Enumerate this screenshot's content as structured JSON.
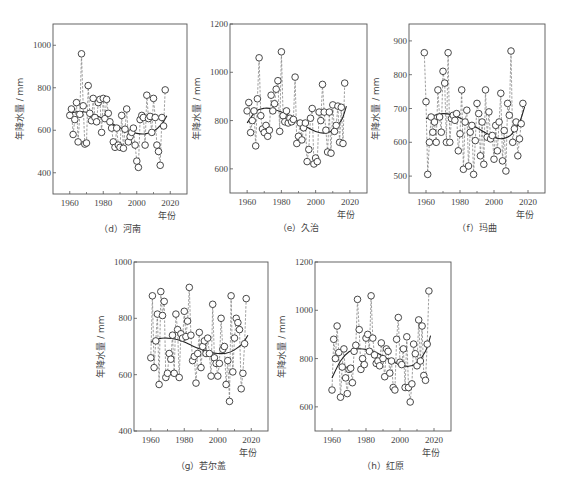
{
  "chart_data": [
    {
      "id": "d",
      "type": "scatter",
      "title": "（d）河南",
      "caption": "（d）河南",
      "xlabel": "年份",
      "ylabel": "年降水量 / mm",
      "xlim": [
        1950,
        2030
      ],
      "ylim": [
        300,
        1100
      ],
      "xticks": [
        1960,
        1980,
        2000,
        2020
      ],
      "xminor": [
        1970,
        1990,
        2010
      ],
      "yticks": [
        400,
        600,
        800,
        1000
      ],
      "frame": {
        "x0": 53,
        "x1": 187,
        "y0": 24,
        "y1": 194
      },
      "x": [
        1960,
        1961,
        1962,
        1963,
        1964,
        1965,
        1966,
        1967,
        1968,
        1969,
        1970,
        1971,
        1972,
        1973,
        1974,
        1975,
        1976,
        1977,
        1978,
        1979,
        1980,
        1981,
        1982,
        1983,
        1984,
        1985,
        1986,
        1987,
        1988,
        1989,
        1990,
        1991,
        1992,
        1993,
        1994,
        1995,
        1996,
        1997,
        1998,
        1999,
        2000,
        2001,
        2002,
        2003,
        2004,
        2005,
        2006,
        2007,
        2008,
        2009,
        2010,
        2011,
        2012,
        2013,
        2014,
        2015,
        2016,
        2017
      ],
      "values": [
        670,
        700,
        580,
        650,
        730,
        545,
        675,
        960,
        715,
        535,
        540,
        810,
        680,
        645,
        750,
        660,
        640,
        730,
        745,
        590,
        750,
        655,
        745,
        680,
        640,
        610,
        545,
        520,
        610,
        530,
        520,
        670,
        515,
        605,
        700,
        545,
        570,
        590,
        610,
        530,
        455,
        425,
        650,
        670,
        660,
        530,
        765,
        655,
        665,
        590,
        750,
        660,
        530,
        500,
        435,
        660,
        620,
        790
      ],
      "trend": {
        "type": "polynomial",
        "points": [
          [
            1960,
            680
          ],
          [
            1965,
            688
          ],
          [
            1970,
            685
          ],
          [
            1975,
            672
          ],
          [
            1980,
            655
          ],
          [
            1985,
            633
          ],
          [
            1990,
            612
          ],
          [
            1995,
            597
          ],
          [
            2000,
            585
          ],
          [
            2005,
            583
          ],
          [
            2010,
            595
          ],
          [
            2015,
            630
          ],
          [
            2018,
            668
          ]
        ]
      }
    },
    {
      "id": "e",
      "type": "scatter",
      "title": "（e）久治",
      "caption": "（e）久治",
      "xlabel": "年份",
      "ylabel": "年降水量 / mm",
      "xlim": [
        1950,
        2030
      ],
      "ylim": [
        500,
        1200
      ],
      "xticks": [
        1960,
        1980,
        2000,
        2020
      ],
      "xminor": [
        1970,
        1990,
        2010
      ],
      "yticks": [
        600,
        800,
        1000,
        1200
      ],
      "frame": {
        "x0": 230,
        "x1": 367,
        "y0": 24,
        "y1": 193
      },
      "x": [
        1960,
        1961,
        1962,
        1963,
        1964,
        1965,
        1966,
        1967,
        1968,
        1969,
        1970,
        1971,
        1972,
        1973,
        1974,
        1975,
        1976,
        1977,
        1978,
        1979,
        1980,
        1981,
        1982,
        1983,
        1984,
        1985,
        1986,
        1987,
        1988,
        1989,
        1990,
        1991,
        1992,
        1993,
        1994,
        1995,
        1996,
        1997,
        1998,
        1999,
        2000,
        2001,
        2002,
        2003,
        2004,
        2005,
        2006,
        2007,
        2008,
        2009,
        2010,
        2011,
        2012,
        2013,
        2014,
        2015,
        2016,
        2017
      ],
      "values": [
        840,
        875,
        750,
        800,
        840,
        695,
        890,
        1060,
        820,
        765,
        750,
        780,
        735,
        760,
        905,
        840,
        870,
        930,
        965,
        755,
        1085,
        820,
        795,
        840,
        790,
        810,
        795,
        805,
        980,
        705,
        735,
        790,
        720,
        770,
        790,
        630,
        680,
        810,
        850,
        620,
        645,
        630,
        835,
        800,
        950,
        835,
        760,
        670,
        835,
        665,
        865,
        755,
        780,
        860,
        710,
        855,
        705,
        955
      ],
      "trend": {
        "type": "polynomial",
        "points": [
          [
            1960,
            790
          ],
          [
            1965,
            838
          ],
          [
            1970,
            851
          ],
          [
            1975,
            848
          ],
          [
            1980,
            835
          ],
          [
            1985,
            818
          ],
          [
            1990,
            795
          ],
          [
            1995,
            772
          ],
          [
            2000,
            755
          ],
          [
            2005,
            748
          ],
          [
            2010,
            760
          ],
          [
            2015,
            800
          ],
          [
            2018,
            860
          ]
        ]
      }
    },
    {
      "id": "f",
      "type": "scatter",
      "title": "（f）玛曲",
      "caption": "（f）玛曲",
      "xlabel": "年份",
      "ylabel": "年降水量 / mm",
      "xlim": [
        1950,
        2030
      ],
      "ylim": [
        450,
        950
      ],
      "xticks": [
        1960,
        1980,
        2000,
        2020
      ],
      "xminor": [
        1970,
        1990,
        2010
      ],
      "yticks": [
        500,
        600,
        700,
        800,
        900
      ],
      "frame": {
        "x0": 409,
        "x1": 545,
        "y0": 24,
        "y1": 193
      },
      "x": [
        1959,
        1960,
        1961,
        1962,
        1963,
        1964,
        1965,
        1966,
        1967,
        1968,
        1969,
        1970,
        1971,
        1972,
        1973,
        1974,
        1975,
        1976,
        1977,
        1978,
        1979,
        1980,
        1981,
        1982,
        1983,
        1984,
        1985,
        1986,
        1987,
        1988,
        1989,
        1990,
        1991,
        1992,
        1993,
        1994,
        1995,
        1996,
        1997,
        1998,
        1999,
        2000,
        2001,
        2002,
        2003,
        2004,
        2005,
        2006,
        2007,
        2008,
        2009,
        2010,
        2011,
        2012,
        2013,
        2014,
        2015,
        2016,
        2017
      ],
      "values": [
        865,
        720,
        505,
        600,
        675,
        630,
        660,
        600,
        755,
        675,
        630,
        810,
        775,
        600,
        865,
        600,
        670,
        680,
        665,
        685,
        575,
        625,
        755,
        520,
        660,
        695,
        530,
        630,
        650,
        505,
        605,
        715,
        685,
        560,
        660,
        535,
        755,
        615,
        690,
        610,
        620,
        550,
        650,
        575,
        660,
        745,
        545,
        635,
        515,
        715,
        680,
        870,
        600,
        640,
        660,
        560,
        610,
        655,
        715
      ],
      "trend": {
        "type": "polynomial",
        "points": [
          [
            1960,
            670
          ],
          [
            1965,
            680
          ],
          [
            1970,
            685
          ],
          [
            1975,
            682
          ],
          [
            1980,
            672
          ],
          [
            1985,
            658
          ],
          [
            1990,
            643
          ],
          [
            1995,
            628
          ],
          [
            2000,
            615
          ],
          [
            2005,
            611
          ],
          [
            2010,
            622
          ],
          [
            2015,
            660
          ],
          [
            2018,
            705
          ]
        ]
      }
    },
    {
      "id": "g",
      "type": "scatter",
      "title": "（g）若尔盖",
      "caption": "（g）若尔盖",
      "xlabel": "年份",
      "ylabel": "年降水量 / mm",
      "xlim": [
        1950,
        2030
      ],
      "ylim": [
        400,
        1000
      ],
      "xticks": [
        1960,
        1980,
        2000,
        2020
      ],
      "xminor": [
        1970,
        1990,
        2010
      ],
      "yticks": [
        400,
        600,
        800,
        1000
      ],
      "frame": {
        "x0": 134,
        "x1": 268,
        "y0": 262,
        "y1": 431
      },
      "x": [
        1960,
        1961,
        1962,
        1963,
        1964,
        1965,
        1966,
        1967,
        1968,
        1969,
        1970,
        1971,
        1972,
        1973,
        1974,
        1975,
        1976,
        1977,
        1978,
        1979,
        1980,
        1981,
        1982,
        1983,
        1984,
        1985,
        1986,
        1987,
        1988,
        1989,
        1990,
        1991,
        1992,
        1993,
        1994,
        1995,
        1996,
        1997,
        1998,
        1999,
        2000,
        2001,
        2002,
        2003,
        2004,
        2005,
        2006,
        2007,
        2008,
        2009,
        2010,
        2011,
        2012,
        2013,
        2014,
        2015,
        2016,
        2017
      ],
      "values": [
        660,
        880,
        625,
        720,
        815,
        565,
        895,
        810,
        860,
        590,
        605,
        675,
        655,
        740,
        605,
        815,
        760,
        590,
        745,
        730,
        825,
        735,
        790,
        910,
        740,
        650,
        665,
        570,
        675,
        750,
        625,
        700,
        720,
        675,
        730,
        675,
        595,
        850,
        660,
        640,
        595,
        640,
        800,
        690,
        700,
        565,
        650,
        505,
        880,
        610,
        730,
        800,
        785,
        760,
        550,
        605,
        710,
        870
      ],
      "trend": {
        "type": "polynomial",
        "points": [
          [
            1960,
            715
          ],
          [
            1965,
            728
          ],
          [
            1970,
            730
          ],
          [
            1975,
            726
          ],
          [
            1980,
            716
          ],
          [
            1985,
            702
          ],
          [
            1990,
            690
          ],
          [
            1995,
            680
          ],
          [
            2000,
            675
          ],
          [
            2005,
            676
          ],
          [
            2010,
            688
          ],
          [
            2015,
            712
          ],
          [
            2018,
            740
          ]
        ]
      }
    },
    {
      "id": "h",
      "type": "scatter",
      "title": "（h）红原",
      "caption": "（h）红原",
      "xlabel": "年份",
      "ylabel": "年降水量 / mm",
      "xlim": [
        1950,
        2030
      ],
      "ylim": [
        500,
        1200
      ],
      "xticks": [
        1960,
        1980,
        2000,
        2020
      ],
      "xminor": [
        1970,
        1990,
        2010
      ],
      "yticks": [
        600,
        800,
        1000,
        1200
      ],
      "frame": {
        "x0": 315,
        "x1": 451,
        "y0": 262,
        "y1": 431
      },
      "x": [
        1960,
        1961,
        1962,
        1963,
        1964,
        1965,
        1966,
        1967,
        1968,
        1969,
        1970,
        1971,
        1972,
        1973,
        1974,
        1975,
        1976,
        1977,
        1978,
        1979,
        1980,
        1981,
        1982,
        1983,
        1984,
        1985,
        1986,
        1987,
        1988,
        1989,
        1990,
        1991,
        1992,
        1993,
        1994,
        1995,
        1996,
        1997,
        1998,
        1999,
        2000,
        2001,
        2002,
        2003,
        2004,
        2005,
        2006,
        2007,
        2008,
        2009,
        2010,
        2011,
        2012,
        2013,
        2014,
        2015,
        2016,
        2017
      ],
      "values": [
        670,
        880,
        800,
        935,
        825,
        640,
        765,
        840,
        720,
        655,
        755,
        760,
        700,
        830,
        855,
        1045,
        920,
        755,
        800,
        775,
        885,
        900,
        830,
        1060,
        885,
        815,
        780,
        790,
        770,
        865,
        800,
        725,
        840,
        830,
        740,
        790,
        680,
        670,
        880,
        970,
        785,
        775,
        840,
        680,
        890,
        680,
        620,
        695,
        860,
        820,
        770,
        960,
        790,
        935,
        730,
        710,
        860,
        1080
      ],
      "trend": {
        "type": "polynomial",
        "points": [
          [
            1960,
            720
          ],
          [
            1965,
            790
          ],
          [
            1970,
            828
          ],
          [
            1975,
            840
          ],
          [
            1980,
            838
          ],
          [
            1985,
            828
          ],
          [
            1990,
            810
          ],
          [
            1995,
            790
          ],
          [
            2000,
            775
          ],
          [
            2005,
            768
          ],
          [
            2010,
            782
          ],
          [
            2015,
            830
          ],
          [
            2018,
            895
          ]
        ]
      }
    }
  ]
}
